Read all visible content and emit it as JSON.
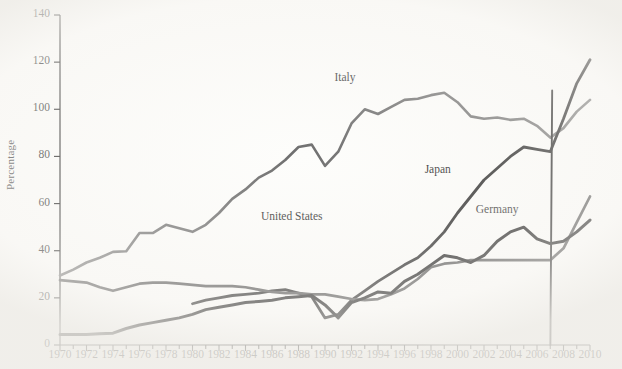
{
  "figure": {
    "background_color": "#fdfdfb",
    "y_axis_title": "Percentage",
    "x_axis_title": ""
  },
  "chart_data": {
    "type": "line",
    "title": "",
    "subtitle": "",
    "xlabel": "",
    "ylabel": "Percentage",
    "xlim": [
      1970,
      2010
    ],
    "ylim": [
      0,
      140
    ],
    "grid": false,
    "legend": "inline-annotations",
    "y_ticks": [
      0,
      20,
      40,
      60,
      80,
      100,
      120,
      140
    ],
    "x_ticks": [
      1970,
      1972,
      1974,
      1976,
      1978,
      1980,
      1982,
      1984,
      1986,
      1988,
      1990,
      1992,
      1994,
      1996,
      1998,
      2000,
      2002,
      2004,
      2006,
      2008,
      2010
    ],
    "x_minor_tick_step": 1,
    "series": [
      {
        "name": "Italy",
        "color": "#6e6e6e",
        "width": 2.6,
        "label_x": 1991.5,
        "label_y": 113,
        "x": [
          1970,
          1971,
          1972,
          1973,
          1974,
          1975,
          1976,
          1977,
          1978,
          1979,
          1980,
          1981,
          1982,
          1983,
          1984,
          1985,
          1986,
          1987,
          1988,
          1989,
          1990,
          1991,
          1992,
          1993,
          1994,
          1995,
          1996,
          1997,
          1998,
          1999,
          2000,
          2001,
          2002,
          2003,
          2004,
          2005,
          2006,
          2007,
          2008,
          2009,
          2010
        ],
        "values": [
          29.5,
          32,
          35,
          37,
          39.5,
          39.8,
          47.5,
          47.5,
          51,
          49.5,
          48,
          51,
          56,
          62,
          66,
          71,
          74,
          78.5,
          84,
          85,
          76,
          82,
          94,
          100,
          98,
          101,
          104,
          104.5,
          106,
          107,
          103,
          97,
          96,
          96.5,
          95.5,
          96,
          93,
          88,
          92,
          99,
          104
        ]
      },
      {
        "name": "Japan",
        "color": "#1a1a1a",
        "width": 2.8,
        "label_x": 1998.5,
        "label_y": 74,
        "x": [
          1980,
          1981,
          1982,
          1983,
          1984,
          1985,
          1986,
          1987,
          1988,
          1989,
          1990,
          1991,
          1992,
          1993,
          1994,
          1995,
          1996,
          1997,
          1998,
          1999,
          2000,
          2001,
          2002,
          2003,
          2004,
          2005,
          2006,
          2007,
          2008,
          2009,
          2010
        ],
        "values": [
          17.5,
          19,
          20,
          21,
          21.5,
          22,
          23,
          23.5,
          22,
          20.5,
          11.5,
          13,
          19,
          23,
          27,
          30.5,
          34,
          37,
          42,
          48,
          56,
          63,
          70,
          75,
          80,
          84,
          83,
          82,
          96,
          111,
          121
        ]
      },
      {
        "name": "United States",
        "color": "#4a4a4a",
        "width": 2.7,
        "label_x": 1987.5,
        "label_y": 54,
        "x": [
          1970,
          1971,
          1972,
          1973,
          1974,
          1975,
          1976,
          1977,
          1978,
          1979,
          1980,
          1981,
          1982,
          1983,
          1984,
          1985,
          1986,
          1987,
          1988,
          1989,
          1990,
          1991,
          1992,
          1993,
          1994,
          1995,
          1996,
          1997,
          1998,
          1999,
          2000,
          2001,
          2002,
          2003,
          2004,
          2005,
          2006,
          2007,
          2008,
          2009,
          2010
        ],
        "values": [
          27.5,
          27,
          26.5,
          24.5,
          23,
          24.5,
          26,
          26.5,
          26.5,
          26,
          25.5,
          25,
          25,
          25,
          24.5,
          23.5,
          22.5,
          22,
          22,
          21.5,
          21.5,
          20.5,
          19.5,
          19,
          19.5,
          21.5,
          24,
          28,
          33,
          34.5,
          35,
          36,
          36,
          36,
          36,
          36,
          36,
          36,
          41,
          52,
          63
        ]
      },
      {
        "name": "Germany",
        "color": "#111111",
        "width": 3.0,
        "label_x": 2003.0,
        "label_y": 57,
        "x": [
          1970,
          1971,
          1972,
          1973,
          1974,
          1975,
          1976,
          1977,
          1978,
          1979,
          1980,
          1981,
          1982,
          1983,
          1984,
          1985,
          1986,
          1987,
          1988,
          1989,
          1990,
          1991,
          1992,
          1993,
          1994,
          1995,
          1996,
          1997,
          1998,
          1999,
          2000,
          2001,
          2002,
          2003,
          2004,
          2005,
          2006,
          2007,
          2008,
          2009,
          2010
        ],
        "values": [
          4.5,
          4.5,
          4.5,
          4.8,
          5,
          7,
          8.5,
          9.5,
          10.5,
          11.5,
          13,
          15,
          16,
          17,
          18,
          18.5,
          19,
          20,
          20.5,
          21,
          17,
          11.5,
          18,
          20,
          22.5,
          22,
          27,
          30,
          34,
          38,
          37,
          35,
          38,
          44,
          48,
          50,
          45,
          43,
          44,
          48,
          53
        ]
      }
    ],
    "annotations": [
      {
        "name": "vertical-artifact-line",
        "description": "near-vertical dark stroke at approximately 2007 spanning 0 to 108 percent",
        "x": 2007.1,
        "y_top": 108,
        "y_bottom": 0,
        "color": "#1a1a1a"
      }
    ]
  },
  "labels": {
    "italy": "Italy",
    "japan": "Japan",
    "united_states": "United States",
    "germany": "Germany",
    "percentage": "Percentage"
  }
}
